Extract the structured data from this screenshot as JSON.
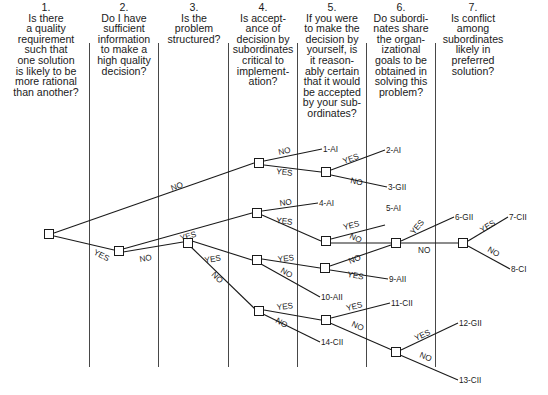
{
  "questions": [
    {
      "number": "1.",
      "text": "Is there a quality requirement such that one solution is likely to be more rational than another?",
      "lines": [
        "Is there",
        "a quality",
        "requirement",
        "such that",
        "one solution",
        "is likely to be",
        "more rational",
        "than another?"
      ]
    },
    {
      "number": "2.",
      "text": "Do I have sufficient information to make a high quality decision?",
      "lines": [
        "Do I have",
        "sufficient",
        "information",
        "to make a",
        "high quality",
        "decision?"
      ]
    },
    {
      "number": "3.",
      "text": "Is the problem structured?",
      "lines": [
        "Is the",
        "problem",
        "structured?"
      ]
    },
    {
      "number": "4.",
      "text": "Is acceptance of decision by subordinates critical to implementation?",
      "lines": [
        "Is accept-",
        "ance of",
        "decision by",
        "subordinates",
        "critical to",
        "implement-",
        "ation?"
      ]
    },
    {
      "number": "5.",
      "text": "If you were to make the decision by yourself, is it reasonably certain that it would be accepted by your subordinates?",
      "lines": [
        "If you were",
        "to make the",
        "decision by",
        "yourself, is",
        "it reason-",
        "ably certain",
        "that it would",
        "be accepted",
        "by your sub-",
        "ordinates?"
      ]
    },
    {
      "number": "6.",
      "text": "Do subordinates share the organizational goals to be obtained in solving this problem?",
      "lines": [
        "Do subordi-",
        "nates share",
        "the organ-",
        "izational",
        "goals to be",
        "obtained in",
        "solving this",
        "problem?"
      ]
    },
    {
      "number": "7.",
      "text": "Is conflict among subordinates likely in preferred solution?",
      "lines": [
        "Is conflict",
        "among",
        "subordinates",
        "likely in",
        "preferred",
        "solution?"
      ]
    }
  ],
  "branch_labels": {
    "yes": "YES",
    "no": "NO"
  },
  "outcomes": [
    {
      "id": "1",
      "style": "AI",
      "label": "1-AI"
    },
    {
      "id": "2",
      "style": "AI",
      "label": "2-AI"
    },
    {
      "id": "3",
      "style": "GII",
      "label": "3-GII"
    },
    {
      "id": "4",
      "style": "AI",
      "label": "4-AI"
    },
    {
      "id": "5",
      "style": "AI",
      "label": "5-AI"
    },
    {
      "id": "6",
      "style": "GII",
      "label": "6-GII"
    },
    {
      "id": "7",
      "style": "CII",
      "label": "7-CII"
    },
    {
      "id": "8",
      "style": "CI",
      "label": "8-CI"
    },
    {
      "id": "9",
      "style": "AII",
      "label": "9-AII"
    },
    {
      "id": "10",
      "style": "AII",
      "label": "10-AII"
    },
    {
      "id": "11",
      "style": "CII",
      "label": "11-CII"
    },
    {
      "id": "12",
      "style": "GII",
      "label": "12-GII"
    },
    {
      "id": "13",
      "style": "CII",
      "label": "13-CII"
    },
    {
      "id": "14",
      "style": "CII",
      "label": "14-CII"
    }
  ]
}
